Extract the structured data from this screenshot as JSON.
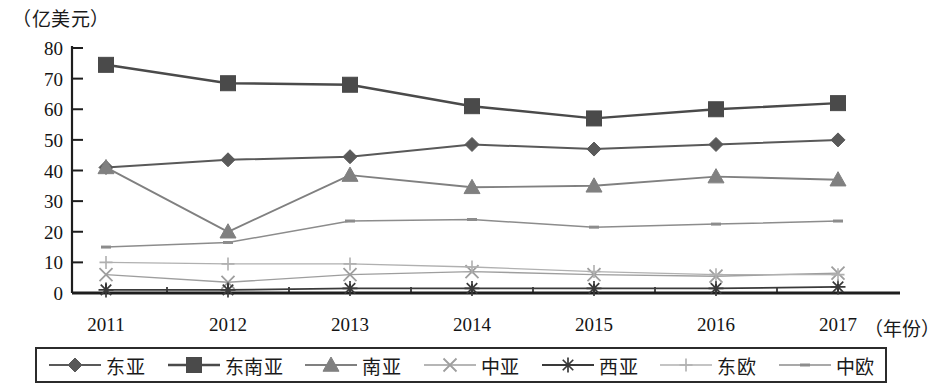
{
  "chart_data": {
    "type": "line",
    "title": "",
    "subtitle": "",
    "xlabel": "（年份）",
    "ylabel": "（亿美元）",
    "categories": [
      "2011",
      "2012",
      "2013",
      "2014",
      "2015",
      "2016",
      "2017"
    ],
    "x": [
      2011,
      2012,
      2013,
      2014,
      2015,
      2016,
      2017
    ],
    "ylim": [
      0,
      80
    ],
    "xlim": [
      2011,
      2017
    ],
    "yticks": [
      "0",
      "10",
      "20",
      "30",
      "40",
      "50",
      "60",
      "70",
      "80"
    ],
    "ytick_values": [
      0,
      10,
      20,
      30,
      40,
      50,
      60,
      70,
      80
    ],
    "grid": false,
    "legend_position": "bottom",
    "series": [
      {
        "name": "东亚",
        "marker": "diamond",
        "color": "#595959",
        "values": [
          41,
          43.5,
          44.5,
          48.5,
          47,
          48.5,
          50
        ]
      },
      {
        "name": "东南亚",
        "marker": "square",
        "color": "#4a4a4a",
        "values": [
          74.5,
          68.5,
          68,
          61,
          57,
          60,
          62
        ]
      },
      {
        "name": "南亚",
        "marker": "triangle",
        "color": "#808080",
        "values": [
          41,
          20,
          38.5,
          34.5,
          35,
          38,
          37
        ]
      },
      {
        "name": "中亚",
        "marker": "x",
        "color": "#9e9e9e",
        "values": [
          6,
          3.5,
          6,
          7,
          6,
          5.5,
          6.5
        ]
      },
      {
        "name": "西亚",
        "marker": "asterisk",
        "color": "#3a3a3a",
        "values": [
          1,
          1,
          1.5,
          1.5,
          1.5,
          1.5,
          2
        ]
      },
      {
        "name": "东欧",
        "marker": "plus",
        "color": "#b0b0b0",
        "values": [
          10,
          9.5,
          9.5,
          8.5,
          7,
          6,
          6
        ]
      },
      {
        "name": "中欧",
        "marker": "dash",
        "color": "#8c8c8c",
        "values": [
          15,
          16.5,
          23.5,
          24,
          21.5,
          22.5,
          23.5
        ]
      }
    ]
  },
  "axes": {
    "y_unit_label": "（亿美元）",
    "x_unit_label": "（年份）"
  }
}
